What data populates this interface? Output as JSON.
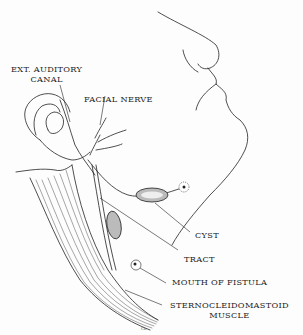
{
  "figure": {
    "labels": {
      "ext_auditory_canal_line1": "EXT. AUDITORY",
      "ext_auditory_canal_line2": "CANAL",
      "facial_nerve": "FACIAL NERVE",
      "cyst": "CYST",
      "tract": "TRACT",
      "mouth_of_fistula": "MOUTH OF FISTULA",
      "sternocleidomastoid_line1": "STERNOCLEIDOMASTOID",
      "sternocleidomastoid_line2": "MUSCLE"
    },
    "signature": "Co.",
    "colors": {
      "ink": "#222222",
      "background": "#fdfdfd"
    }
  }
}
